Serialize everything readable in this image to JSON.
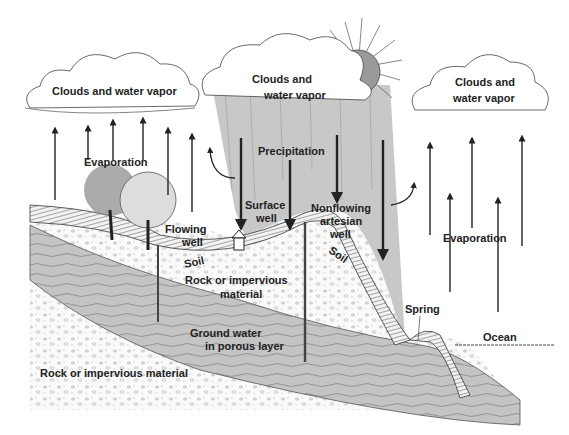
{
  "diagram": {
    "type": "illustration",
    "colors": {
      "background": "#ffffff",
      "rain_shade": "#c8c8c8",
      "sun": "#9a9a9a",
      "groundwater": "#bdbdbd",
      "soil_hatch": "#555555",
      "ink": "#222222"
    },
    "labels": {
      "cloud_left": "Clouds and water vapor",
      "cloud_center_line1": "Clouds and",
      "cloud_center_line2": "water vapor",
      "cloud_right_line1": "Clouds and",
      "cloud_right_line2": "water vapor",
      "evaporation_left": "Evaporation",
      "evaporation_right": "Evaporation",
      "precipitation": "Precipitation",
      "flowing_well_line1": "Flowing",
      "flowing_well_line2": "well",
      "surface_well_line1": "Surface",
      "surface_well_line2": "well",
      "nonflowing_line1": "Nonflowing",
      "nonflowing_line2": "artesian",
      "nonflowing_line3": "well",
      "soil_left": "Soil",
      "soil_right": "Soil",
      "rock_upper_line1": "Rock or impervious",
      "rock_upper_line2": "material",
      "groundwater_line1": "Ground water",
      "groundwater_line2": "in porous layer",
      "rock_lower": "Rock or impervious material",
      "spring": "Spring",
      "ocean": "Ocean"
    }
  }
}
